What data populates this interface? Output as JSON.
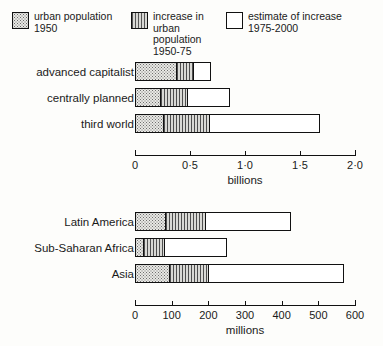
{
  "legend": {
    "items": [
      {
        "name": "urban-population-1950",
        "pattern": "dots",
        "text": "urban population\n1950",
        "x": 12,
        "y": 11,
        "w": 116
      },
      {
        "name": "increase-urban-population-1950-75",
        "pattern": "stripes",
        "text": "increase in\nurban population\n1950-75",
        "x": 131,
        "y": 11,
        "w": 92
      },
      {
        "name": "estimate-of-increase-1975-2000",
        "pattern": "empty",
        "text": "estimate of increase\n1975-2000",
        "x": 226,
        "y": 11,
        "w": 150
      }
    ]
  },
  "chart_data": [
    {
      "type": "bar",
      "orientation": "horizontal",
      "stacked": true,
      "title": "",
      "xlabel": "billions",
      "ylabel": "",
      "unit": "billions",
      "categories": [
        "advanced capitalist",
        "centrally planned",
        "third world"
      ],
      "series": [
        {
          "name": "urban population 1950",
          "values": [
            0.38,
            0.23,
            0.26
          ]
        },
        {
          "name": "increase in urban population 1950-75",
          "values": [
            0.16,
            0.25,
            0.42
          ]
        },
        {
          "name": "estimate of increase 1975-2000",
          "values": [
            0.15,
            0.38,
            1.0
          ]
        }
      ],
      "totals": [
        0.69,
        0.86,
        1.68
      ],
      "xlim": [
        0,
        2.0
      ],
      "xticks": [
        0,
        0.5,
        1.0,
        1.5,
        2.0
      ],
      "xticklabels": [
        "0",
        "0·5",
        "1·0",
        "1·5",
        "2·0"
      ],
      "grid": false,
      "legend_position": "top"
    },
    {
      "type": "bar",
      "orientation": "horizontal",
      "stacked": true,
      "title": "",
      "xlabel": "millions",
      "ylabel": "",
      "unit": "millions",
      "categories": [
        "Latin America",
        "Sub-Saharan Africa",
        "Asia"
      ],
      "series": [
        {
          "name": "urban population 1950",
          "values": [
            82,
            22,
            93
          ]
        },
        {
          "name": "increase in urban population 1950-75",
          "values": [
            112,
            60,
            109
          ]
        },
        {
          "name": "estimate of increase 1975-2000",
          "values": [
            231,
            168,
            368
          ]
        }
      ],
      "totals": [
        425,
        250,
        570
      ],
      "xlim": [
        0,
        600
      ],
      "xticks": [
        0,
        100,
        200,
        300,
        400,
        500,
        600
      ],
      "xticklabels": [
        "0",
        "100",
        "200",
        "300",
        "400",
        "500",
        "600"
      ],
      "grid": false,
      "legend_position": "top"
    }
  ],
  "layout": {
    "charts": [
      {
        "rows_top": [
          62,
          88,
          114
        ],
        "axis_top": 155
      },
      {
        "rows_top": [
          212,
          238,
          264
        ],
        "axis_top": 305
      }
    ]
  }
}
